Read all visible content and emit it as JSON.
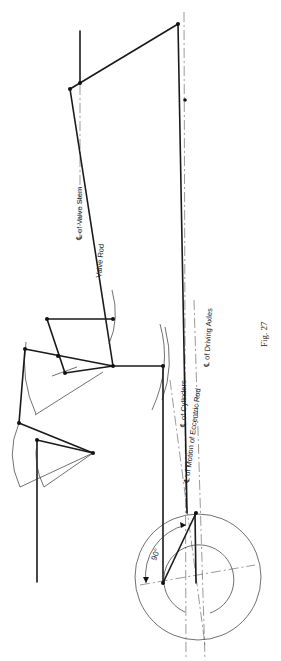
{
  "figure": {
    "caption": "Fig. 27",
    "labels": {
      "valve_stem": "℄ of Valve Stem",
      "valve_rod": "Valve Rod",
      "cylinders": "℄ of Cylinders",
      "driving_axles": "℄ of Driving Axles",
      "eccentric_rod": "℄ of Motion of Eccentric Rod",
      "angle": "90°"
    },
    "colors": {
      "ink": "#1a1a1a",
      "background": "#ffffff"
    }
  }
}
